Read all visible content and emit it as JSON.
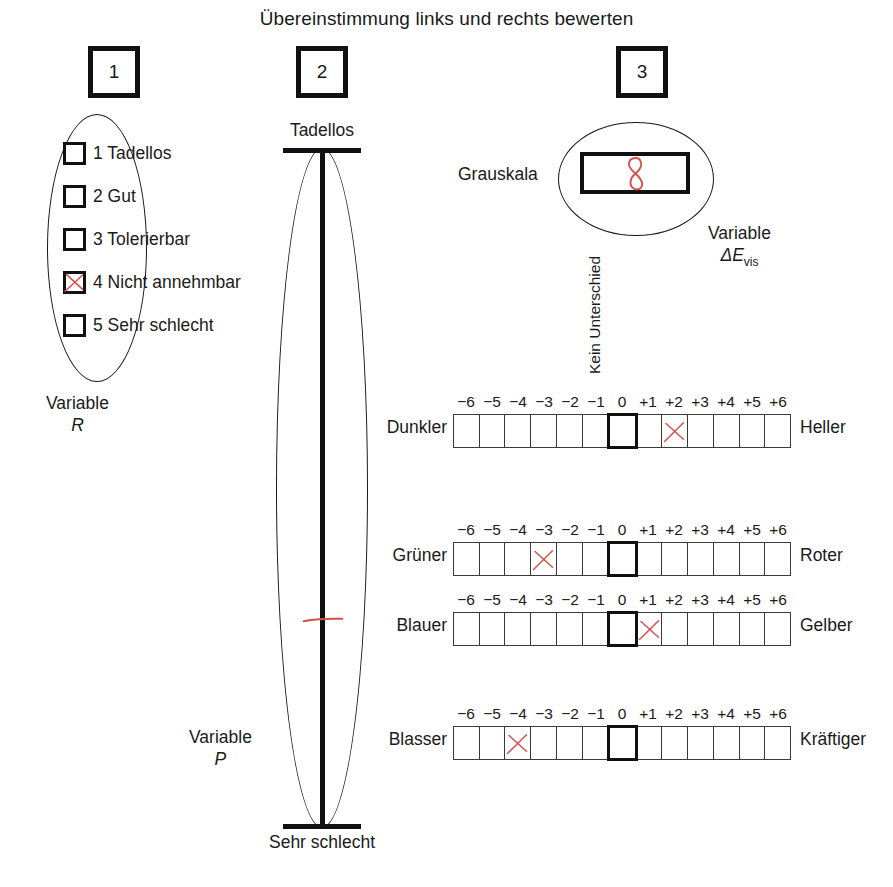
{
  "title": "Übereinstimmung links und rechts bewerten",
  "steps": [
    {
      "number": "1"
    },
    {
      "number": "2"
    },
    {
      "number": "3"
    }
  ],
  "section_r": {
    "variable_caption": "Variable",
    "variable_symbol": "R",
    "options": [
      {
        "number": "1",
        "label": "Tadellos",
        "checked": false
      },
      {
        "number": "2",
        "label": "Gut",
        "checked": false
      },
      {
        "number": "3",
        "label": "Tolerierbar",
        "checked": false
      },
      {
        "number": "4",
        "label": "Nicht annehmbar",
        "checked": true
      },
      {
        "number": "5",
        "label": "Sehr schlecht",
        "checked": false
      }
    ],
    "selected_option": "4"
  },
  "section_p": {
    "top_label": "Tadellos",
    "bottom_label": "Sehr schlecht",
    "variable_caption": "Variable",
    "variable_symbol": "P",
    "mark_position_percent": 69
  },
  "section_e": {
    "grauskala_label": "Grauskala",
    "grauskala_value": "8",
    "variable_caption": "Variable",
    "variable_symbol": "ΔE",
    "variable_subscript": "vis",
    "center_axis_label": "Kein Unterschied"
  },
  "scales": [
    {
      "left_label": "Dunkler",
      "right_label": "Heller",
      "ticks": [
        "−6",
        "−5",
        "−4",
        "−3",
        "−2",
        "−1",
        "0",
        "+1",
        "+2",
        "+3",
        "+4",
        "+5",
        "+6"
      ],
      "marked_value": "+2"
    },
    {
      "left_label": "Grüner",
      "right_label": "Roter",
      "ticks": [
        "−6",
        "−5",
        "−4",
        "−3",
        "−2",
        "−1",
        "0",
        "+1",
        "+2",
        "+3",
        "+4",
        "+5",
        "+6"
      ],
      "marked_value": "−3"
    },
    {
      "left_label": "Blauer",
      "right_label": "Gelber",
      "ticks": [
        "−6",
        "−5",
        "−4",
        "−3",
        "−2",
        "−1",
        "0",
        "+1",
        "+2",
        "+3",
        "+4",
        "+5",
        "+6"
      ],
      "marked_value": "+1"
    },
    {
      "left_label": "Blasser",
      "right_label": "Kräftiger",
      "ticks": [
        "−6",
        "−5",
        "−4",
        "−3",
        "−2",
        "−1",
        "0",
        "+1",
        "+2",
        "+3",
        "+4",
        "+5",
        "+6"
      ],
      "marked_value": "−4"
    }
  ],
  "colors": {
    "ink": "#111111",
    "annotation_red": "#d4504a",
    "paper": "#ffffff"
  }
}
